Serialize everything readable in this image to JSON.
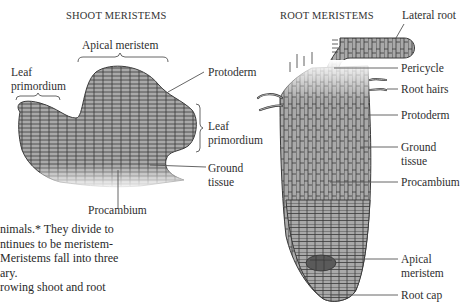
{
  "figure": {
    "shoot": {
      "title": "SHOOT MERISTEMS",
      "labels": {
        "apical_meristem": "Apical meristem",
        "leaf_primordium_left_1": "Leaf",
        "leaf_primordium_left_2": "primordium",
        "protoderm": "Protoderm",
        "leaf_primordium_right_1": "Leaf",
        "leaf_primordium_right_2": "primordium",
        "ground_tissue_1": "Ground",
        "ground_tissue_2": "tissue",
        "procambium": "Procambium"
      }
    },
    "root": {
      "title": "ROOT MERISTEMS",
      "labels": {
        "lateral_root": "Lateral root",
        "pericycle": "Pericycle",
        "root_hairs": "Root hairs",
        "protoderm": "Protoderm",
        "ground_tissue_1": "Ground",
        "ground_tissue_2": "tissue",
        "procambium": "Procambium",
        "apical_meristem_1": "Apical",
        "apical_meristem_2": "meristem",
        "root_cap": "Root cap"
      }
    },
    "colors": {
      "cell_fill": "#a9a9a9",
      "cell_wall": "#3a3a3a",
      "apical_dark": "#5a5a5a",
      "leader_line": "#555555"
    }
  },
  "body_text": {
    "lines": [
      "nimals.* They divide to",
      "ntinues to be meristem-",
      "Meristems fall into three",
      "ary.",
      "rowing shoot and root"
    ]
  }
}
